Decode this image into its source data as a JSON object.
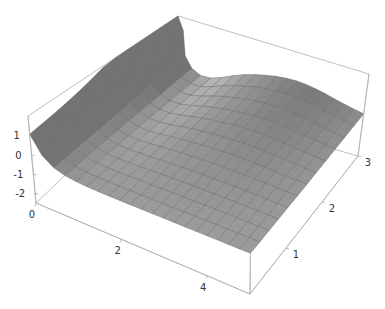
{
  "chart_data": {
    "type": "surface3d",
    "title": "",
    "xlabel": "",
    "ylabel": "",
    "zlabel": "",
    "x_range": [
      0,
      5
    ],
    "y_range": [
      0,
      3
    ],
    "z_range": [
      -2.5,
      2
    ],
    "x_ticks": [
      {
        "value": 0,
        "label": "0"
      },
      {
        "value": 2,
        "label": "2"
      },
      {
        "value": 4,
        "label": "4"
      }
    ],
    "y_ticks": [
      {
        "value": 1,
        "label": "1"
      },
      {
        "value": 2,
        "label": "2"
      },
      {
        "value": 3,
        "label": "3"
      }
    ],
    "z_ticks": [
      {
        "value": 1,
        "label": "1"
      },
      {
        "value": 0,
        "label": "0"
      },
      {
        "value": -1,
        "label": "-1"
      },
      {
        "value": -2,
        "label": "-2"
      }
    ],
    "grid_lines_x": 20,
    "grid_lines_y": 12,
    "box": true,
    "mesh": true,
    "colors": {
      "surface_light": "#e6e6e6",
      "surface_dark": "#8f8f8f",
      "mesh": "#5a5a5a",
      "box": "#b0b0b0"
    }
  }
}
